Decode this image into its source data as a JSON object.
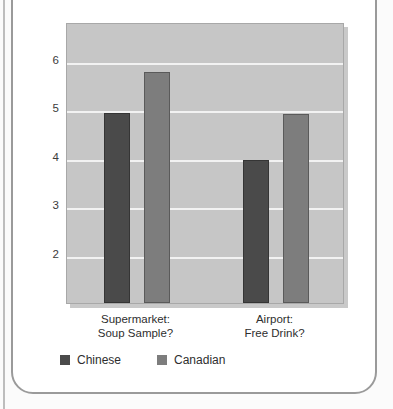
{
  "figure": {
    "caption_clipped": "Figure: Willingness to accept free offers by culture and setting"
  },
  "chart_data": {
    "type": "bar",
    "title": "",
    "xlabel": "",
    "ylabel": "Willingness to accept (1–7)",
    "categories": [
      "Supermarket:\nSoup Sample?",
      "Airport:\nFree Drink?"
    ],
    "category_lines": [
      {
        "line1": "Supermarket:",
        "line2": "Soup Sample?"
      },
      {
        "line1": "Airport:",
        "line2": "Free Drink?"
      }
    ],
    "series": [
      {
        "name": "Chinese",
        "color": "#4a4a4a",
        "values": [
          4.93,
          3.96
        ]
      },
      {
        "name": "Canadian",
        "color": "#7d7d7d",
        "values": [
          5.77,
          4.91
        ]
      }
    ],
    "ylim": [
      1.0,
      6.8
    ],
    "yticks": [
      2,
      3,
      4,
      5,
      6
    ],
    "ytick_labels": [
      "2",
      "3",
      "4",
      "5",
      "6"
    ],
    "grid": true,
    "gridline_color": "#f2f2f2",
    "legend_position": "bottom-left",
    "plot_background": "#c6c6c6"
  },
  "legend": {
    "items": [
      {
        "label": "Chinese",
        "color": "#4a4a4a"
      },
      {
        "label": "Canadian",
        "color": "#7d7d7d"
      }
    ]
  },
  "axis": {
    "y_title": "Willingness to accept (1–7)",
    "y_labels": [
      "6",
      "5",
      "4",
      "3",
      "2"
    ]
  }
}
